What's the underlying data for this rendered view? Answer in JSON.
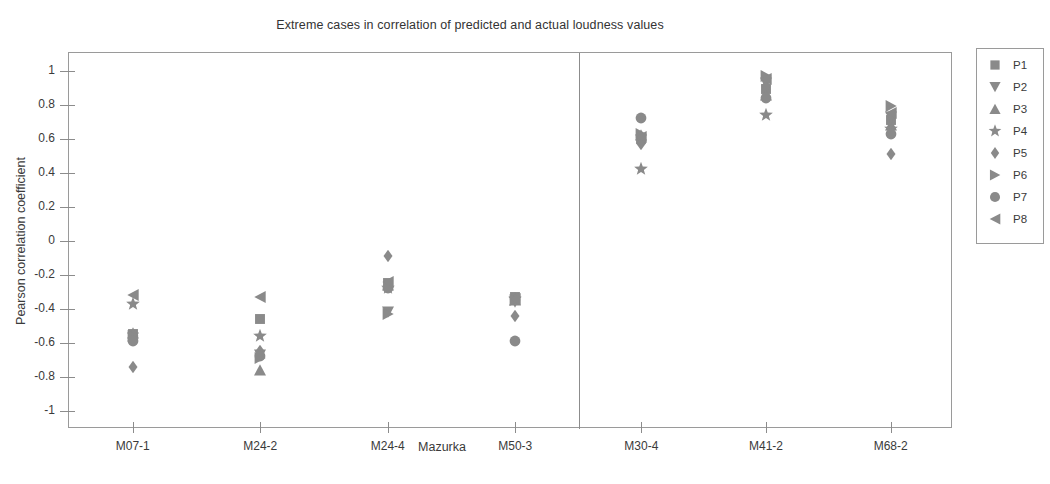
{
  "chart_data": {
    "type": "scatter",
    "title": "Extreme cases in correlation of predicted and actual loudness values",
    "xlabel": "Mazurka",
    "ylabel": "Pearson correlation coefficient",
    "ylim": [
      -1,
      1
    ],
    "yticks": [
      1,
      0.8,
      0.6,
      0.4,
      0.2,
      0,
      -0.2,
      -0.4,
      -0.6,
      -0.8,
      -1
    ],
    "ytick_labels": [
      "1",
      "0.8",
      "0.6",
      "0.4",
      "0.2",
      "0",
      "-0.2",
      "-0.4",
      "-0.6",
      "-0.8",
      "-1"
    ],
    "categories": [
      "M07-1",
      "M24-2",
      "M24-4",
      "M50-3",
      "M30-4",
      "M41-2",
      "M68-2"
    ],
    "grid": false,
    "legend_position": "right-outside",
    "annotations": [
      {
        "type": "vertical-separator",
        "after_category": "M50-3"
      }
    ],
    "series": [
      {
        "name": "P1",
        "marker": "square",
        "values": [
          -0.56,
          -0.47,
          -0.26,
          -0.34,
          0.59,
          0.88,
          0.7
        ]
      },
      {
        "name": "P2",
        "marker": "triangle-down",
        "values": [
          -0.58,
          -0.68,
          -0.43,
          -0.37,
          0.58,
          0.92,
          0.72
        ]
      },
      {
        "name": "P3",
        "marker": "triangle-up",
        "values": [
          -0.55,
          -0.77,
          -0.27,
          -0.36,
          0.61,
          0.85,
          0.67
        ]
      },
      {
        "name": "P4",
        "marker": "star",
        "values": [
          -0.38,
          -0.57,
          -0.29,
          -0.35,
          0.41,
          0.73,
          0.65
        ]
      },
      {
        "name": "P5",
        "marker": "diamond",
        "values": [
          -0.75,
          -0.66,
          -0.1,
          -0.45,
          0.56,
          0.9,
          0.5
        ]
      },
      {
        "name": "P6",
        "marker": "triangle-right",
        "values": [
          -0.57,
          -0.7,
          -0.44,
          -0.36,
          0.62,
          0.96,
          0.78
        ]
      },
      {
        "name": "P7",
        "marker": "circle",
        "values": [
          -0.6,
          -0.69,
          -0.29,
          -0.6,
          0.71,
          0.83,
          0.62
        ]
      },
      {
        "name": "P8",
        "marker": "triangle-left",
        "values": [
          -0.33,
          -0.34,
          -0.25,
          -0.35,
          0.6,
          0.94,
          0.74
        ]
      }
    ],
    "marker_color": "#8a8a8a"
  },
  "legend": {
    "entries": [
      {
        "label": "P1",
        "marker": "square"
      },
      {
        "label": "P2",
        "marker": "triangle-down"
      },
      {
        "label": "P3",
        "marker": "triangle-up"
      },
      {
        "label": "P4",
        "marker": "star"
      },
      {
        "label": "P5",
        "marker": "diamond"
      },
      {
        "label": "P6",
        "marker": "triangle-right"
      },
      {
        "label": "P7",
        "marker": "circle"
      },
      {
        "label": "P8",
        "marker": "triangle-left"
      }
    ]
  }
}
